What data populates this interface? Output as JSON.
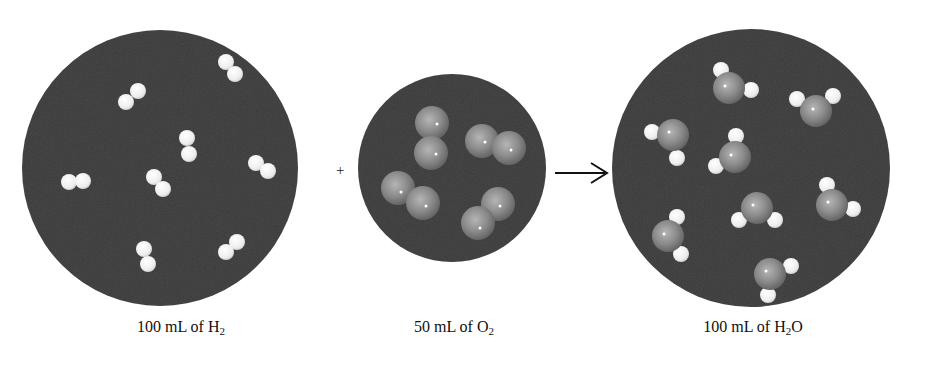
{
  "diagram": {
    "title": "",
    "reaction": "2 H2 + O2 -> 2 H2O (gas volumes)",
    "operators": {
      "plus": "+",
      "arrow": "→"
    },
    "containers": [
      {
        "id": "h2",
        "label_main": "100 mL of H",
        "label_sub": "2",
        "label_tail": "",
        "molecule": "H2",
        "molecule_count": 8,
        "center": [
          160,
          168
        ],
        "radius": 138
      },
      {
        "id": "o2",
        "label_main": "50 mL of O",
        "label_sub": "2",
        "label_tail": "",
        "molecule": "O2",
        "molecule_count": 4,
        "center": [
          452,
          168
        ],
        "radius": 94
      },
      {
        "id": "h2o",
        "label_main": "100 mL of H",
        "label_sub": "2",
        "label_tail": "O",
        "molecule": "H2O",
        "molecule_count": 8,
        "center": [
          751,
          168
        ],
        "radius": 139
      }
    ],
    "colors": {
      "background": "#ffffff",
      "container": "#3a3a3a",
      "hydrogen": "#f2f2f2",
      "oxygen": "#8c8c8c",
      "text": "#111111"
    }
  }
}
